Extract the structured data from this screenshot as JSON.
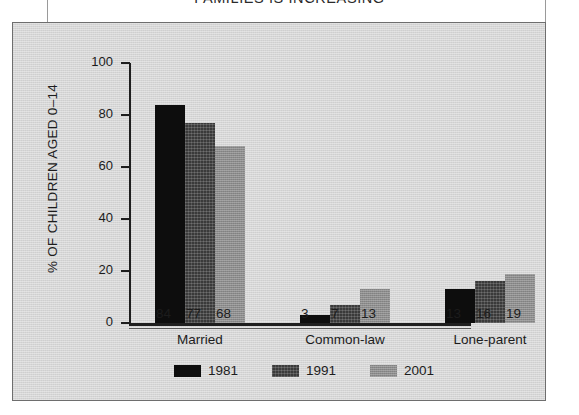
{
  "chart_data": {
    "type": "bar",
    "title": "FAMILIES IS INCREASING",
    "xlabel": "",
    "ylabel": "% OF CHILDREN AGED 0–14",
    "categories": [
      "Married",
      "Common-law",
      "Lone-parent"
    ],
    "series": [
      {
        "name": "1981",
        "color": "#0d0d0d",
        "values": [
          84,
          3,
          13
        ]
      },
      {
        "name": "1991",
        "color": "#3a3a3a",
        "values": [
          77,
          7,
          16
        ]
      },
      {
        "name": "2001",
        "color": "#8c8c8c",
        "values": [
          68,
          13,
          19
        ]
      }
    ],
    "ylim": [
      0,
      100
    ],
    "yticks": [
      0,
      20,
      40,
      60,
      80,
      100
    ],
    "ytick_labels": [
      "0",
      "20",
      "40",
      "60",
      "80",
      "100"
    ],
    "grid": false,
    "legend_position": "bottom",
    "data_labels": true,
    "panel_background": "#d6d6d6",
    "axis_color": "#1e1e1e"
  }
}
